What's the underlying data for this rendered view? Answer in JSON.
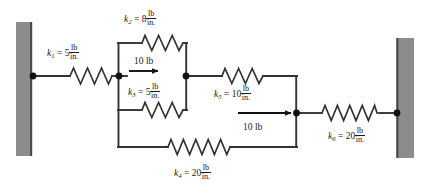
{
  "figure": {
    "stroke_color": "#333333",
    "wall_color": "#8c8c8c",
    "wall_edge_color": "#4a4a4a",
    "node_color": "#111111"
  },
  "walls": [
    {
      "name": "left-wall",
      "x": 16,
      "y": 22,
      "w": 16,
      "h": 134
    },
    {
      "name": "right-wall",
      "x": 398,
      "y": 38,
      "w": 16,
      "h": 120
    }
  ],
  "springs": [
    {
      "id": "k1",
      "symbol": "k",
      "subscript": "1",
      "equals": "=",
      "value": "5",
      "unit_num": "lb",
      "unit_den": "in.",
      "label": "k1 = 5 lb/in.",
      "label_x": 47,
      "label_y": 44
    },
    {
      "id": "k2",
      "symbol": "k",
      "subscript": "2",
      "equals": "=",
      "value": "8",
      "unit_num": "lb",
      "unit_den": "in.",
      "label": "k2 = 8 lb/in.",
      "label_x": 124,
      "label_y": 10
    },
    {
      "id": "k3",
      "symbol": "k",
      "subscript": "3",
      "equals": "=",
      "value": "5",
      "unit_num": "lb",
      "unit_den": "in.",
      "label": "k3 = 5 lb/in.",
      "label_x": 128,
      "label_y": 83
    },
    {
      "id": "k4",
      "symbol": "k",
      "subscript": "4",
      "equals": "=",
      "value": "20",
      "unit_num": "lb",
      "unit_den": "in.",
      "label": "k4 = 20 lb/in.",
      "label_x": 174,
      "label_y": 164
    },
    {
      "id": "k5",
      "symbol": "k",
      "subscript": "5",
      "equals": "=",
      "value": "10",
      "unit_num": "lb",
      "unit_den": "in.",
      "label": "k5 = 10 lb/in.",
      "label_x": 214,
      "label_y": 85
    },
    {
      "id": "k6",
      "symbol": "k",
      "subscript": "6",
      "equals": "=",
      "value": "20",
      "unit_num": "lb",
      "unit_den": "in.",
      "label": "k6 = 20 lb/in.",
      "label_x": 328,
      "label_y": 127
    }
  ],
  "forces": [
    {
      "id": "force-left",
      "label": "10 lb",
      "label_x": 134,
      "label_y": 57
    },
    {
      "id": "force-right",
      "label": "10 lb",
      "label_x": 243,
      "label_y": 123
    }
  ]
}
